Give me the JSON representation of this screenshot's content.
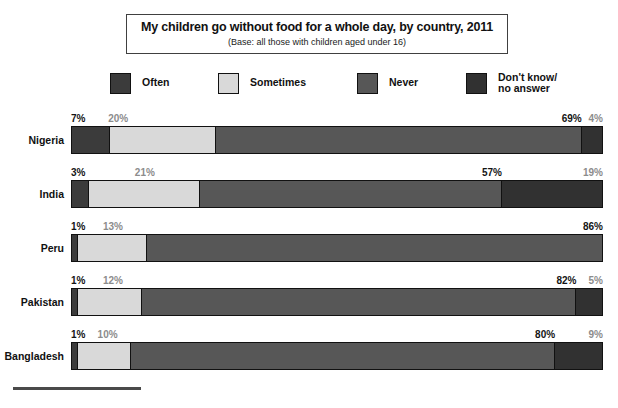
{
  "title": {
    "main": "My children go without food for a whole day, by country, 2011",
    "sub": "(Base: all those with children aged under 16)"
  },
  "legend": [
    {
      "label": "Often",
      "color": "#3b3b3b",
      "x": 110
    },
    {
      "label": "Sometimes",
      "color": "#d9d9d9",
      "x": 218
    },
    {
      "label": "Never",
      "color": "#575757",
      "x": 357
    },
    {
      "label": "Don't know/\nno answer",
      "color": "#313131",
      "x": 466
    }
  ],
  "chart_data": {
    "type": "bar",
    "orientation": "horizontal",
    "stacked": true,
    "percent": true,
    "title": "My children go without food for a whole day, by country, 2011",
    "subtitle": "(Base: all those with children aged under 16)",
    "xlabel": "",
    "ylabel": "",
    "xlim": [
      0,
      100
    ],
    "grid": false,
    "legend_position": "top",
    "categories": [
      "Nigeria",
      "India",
      "Peru",
      "Pakistan",
      "Bangladesh"
    ],
    "series": [
      {
        "name": "Often",
        "color": "#3b3b3b",
        "values": [
          7,
          3,
          1,
          1,
          1
        ]
      },
      {
        "name": "Sometimes",
        "color": "#d9d9d9",
        "values": [
          20,
          21,
          13,
          12,
          10
        ]
      },
      {
        "name": "Never",
        "color": "#575757",
        "values": [
          69,
          57,
          86,
          82,
          80
        ]
      },
      {
        "name": "Don't know/no answer",
        "color": "#313131",
        "values": [
          4,
          19,
          0,
          5,
          9
        ]
      }
    ],
    "rows": [
      {
        "country": "Nigeria",
        "labels": [
          {
            "text": "7%",
            "value": 7,
            "tone": "dark",
            "align": "left",
            "pos": 0
          },
          {
            "text": "20%",
            "value": 20,
            "tone": "muted",
            "align": "left",
            "pos": 7
          },
          {
            "text": "69%",
            "value": 69,
            "tone": "dark",
            "align": "right",
            "pos": 96
          },
          {
            "text": "4%",
            "value": 4,
            "tone": "muted",
            "align": "right",
            "pos": 100
          }
        ]
      },
      {
        "country": "India",
        "labels": [
          {
            "text": "3%",
            "value": 3,
            "tone": "dark",
            "align": "left",
            "pos": 0
          },
          {
            "text": "21%",
            "value": 21,
            "tone": "muted",
            "align": "left",
            "pos": 12
          },
          {
            "text": "57%",
            "value": 57,
            "tone": "dark",
            "align": "right",
            "pos": 81
          },
          {
            "text": "19%",
            "value": 19,
            "tone": "muted",
            "align": "right",
            "pos": 100
          }
        ]
      },
      {
        "country": "Peru",
        "labels": [
          {
            "text": "1%",
            "value": 1,
            "tone": "dark",
            "align": "left",
            "pos": 0
          },
          {
            "text": "13%",
            "value": 13,
            "tone": "muted",
            "align": "left",
            "pos": 6
          },
          {
            "text": "86%",
            "value": 86,
            "tone": "dark",
            "align": "right",
            "pos": 100
          }
        ]
      },
      {
        "country": "Pakistan",
        "labels": [
          {
            "text": "1%",
            "value": 1,
            "tone": "dark",
            "align": "left",
            "pos": 0
          },
          {
            "text": "12%",
            "value": 12,
            "tone": "muted",
            "align": "left",
            "pos": 6
          },
          {
            "text": "82%",
            "value": 82,
            "tone": "dark",
            "align": "right",
            "pos": 95
          },
          {
            "text": "5%",
            "value": 5,
            "tone": "muted",
            "align": "right",
            "pos": 100
          }
        ]
      },
      {
        "country": "Bangladesh",
        "labels": [
          {
            "text": "1%",
            "value": 1,
            "tone": "dark",
            "align": "left",
            "pos": 0
          },
          {
            "text": "10%",
            "value": 10,
            "tone": "muted",
            "align": "left",
            "pos": 5
          },
          {
            "text": "80%",
            "value": 80,
            "tone": "dark",
            "align": "right",
            "pos": 91
          },
          {
            "text": "9%",
            "value": 9,
            "tone": "muted",
            "align": "right",
            "pos": 100
          }
        ]
      }
    ]
  }
}
